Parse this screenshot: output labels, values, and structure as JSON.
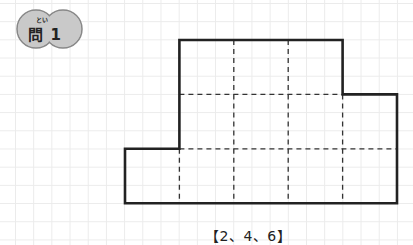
{
  "question_badge": {
    "ruby": "とい",
    "label": "問 1",
    "fill_color": "#c9c9c9",
    "stroke_color": "#888888"
  },
  "figure": {
    "rows": [
      {
        "row": 1,
        "start_col": 2,
        "cells": 3
      },
      {
        "row": 2,
        "start_col": 2,
        "cells": 4
      },
      {
        "row": 3,
        "start_col": 1,
        "cells": 5
      }
    ],
    "outline_color": "#222222",
    "dash_color": "#333333"
  },
  "caption": "【2、4、6】"
}
